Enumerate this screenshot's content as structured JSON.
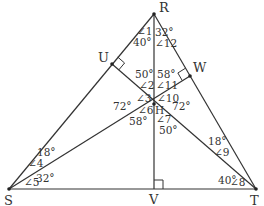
{
  "diagram": {
    "colors": {
      "line": "#333333",
      "text": "#333333",
      "background": "#ffffff"
    },
    "vertices": {
      "R": {
        "label": "R",
        "x": 154,
        "y": 14
      },
      "S": {
        "label": "S",
        "x": 9,
        "y": 189
      },
      "T": {
        "label": "T",
        "x": 256,
        "y": 189
      },
      "U": {
        "label": "U",
        "x": 112,
        "y": 64
      },
      "W": {
        "label": "W",
        "x": 190,
        "y": 76
      },
      "V": {
        "label": "V",
        "x": 154,
        "y": 189
      },
      "H": {
        "label": "H",
        "x": 154,
        "y": 104
      }
    },
    "segments": [
      [
        "R",
        "S"
      ],
      [
        "R",
        "T"
      ],
      [
        "S",
        "T"
      ],
      [
        "R",
        "V"
      ],
      [
        "S",
        "W"
      ],
      [
        "T",
        "U"
      ]
    ],
    "right_angles": [
      "U",
      "W",
      "V"
    ],
    "angle_labels": [
      {
        "name": "∠1",
        "text": "∠1",
        "x": 137,
        "y": 35
      },
      {
        "name": "∠1-value",
        "text": "40°",
        "x": 133,
        "y": 46
      },
      {
        "name": "∠12-value",
        "text": "32°",
        "x": 155,
        "y": 36
      },
      {
        "name": "∠12",
        "text": "∠12",
        "x": 155,
        "y": 47
      },
      {
        "name": "∠2-value",
        "text": "50°",
        "x": 135,
        "y": 78
      },
      {
        "name": "∠2",
        "text": "∠2",
        "x": 139,
        "y": 89
      },
      {
        "name": "∠11-value",
        "text": "58°",
        "x": 157,
        "y": 78
      },
      {
        "name": "∠11",
        "text": "∠11",
        "x": 156,
        "y": 89
      },
      {
        "name": "∠3",
        "text": "∠3",
        "x": 136,
        "y": 102
      },
      {
        "name": "∠10",
        "text": "∠10",
        "x": 157,
        "y": 102
      },
      {
        "name": "∠3-value",
        "text": "72°",
        "x": 113,
        "y": 110
      },
      {
        "name": "∠10-value",
        "text": "72°",
        "x": 172,
        "y": 110
      },
      {
        "name": "∠6",
        "text": "∠6",
        "x": 138,
        "y": 114
      },
      {
        "name": "H-label",
        "text": "H",
        "x": 155,
        "y": 114
      },
      {
        "name": "∠6-value",
        "text": "58°",
        "x": 129,
        "y": 125
      },
      {
        "name": "∠7",
        "text": "∠7",
        "x": 156,
        "y": 123
      },
      {
        "name": "∠7-value",
        "text": "50°",
        "x": 159,
        "y": 134
      },
      {
        "name": "∠4-value",
        "text": "18°",
        "x": 37,
        "y": 156
      },
      {
        "name": "∠4",
        "text": "∠4",
        "x": 28,
        "y": 167
      },
      {
        "name": "∠5",
        "text": "∠5",
        "x": 24,
        "y": 186
      },
      {
        "name": "∠5-value",
        "text": "32°",
        "x": 36,
        "y": 182
      },
      {
        "name": "∠9-value",
        "text": "18°",
        "x": 208,
        "y": 145
      },
      {
        "name": "∠9",
        "text": "∠9",
        "x": 214,
        "y": 156
      },
      {
        "name": "∠8-value",
        "text": "40°",
        "x": 218,
        "y": 184
      },
      {
        "name": "∠8",
        "text": "∠8",
        "x": 230,
        "y": 186
      }
    ]
  }
}
